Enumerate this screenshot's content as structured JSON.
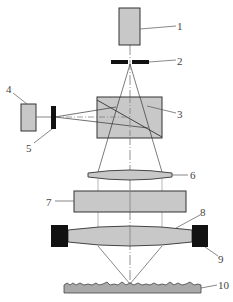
{
  "diagram": {
    "type": "optical-schematic",
    "colors": {
      "component_fill": "#c8c8c8",
      "stroke": "#333333",
      "block_fill": "#111111",
      "sample_fill": "#a9a9a9"
    },
    "labels": {
      "l1": "1",
      "l2": "2",
      "l3": "3",
      "l4": "4",
      "l5": "5",
      "l6": "6",
      "l7": "7",
      "l8": "8",
      "l9": "9",
      "l10": "10"
    },
    "components": [
      {
        "id": 1,
        "shape": "rectangle",
        "position": "top"
      },
      {
        "id": 2,
        "shape": "slit-aperture"
      },
      {
        "id": 3,
        "shape": "beam-splitter-box"
      },
      {
        "id": 4,
        "shape": "rectangle",
        "position": "left"
      },
      {
        "id": 5,
        "shape": "pinhole"
      },
      {
        "id": 6,
        "shape": "thin-lens"
      },
      {
        "id": 7,
        "shape": "rectangle"
      },
      {
        "id": 8,
        "shape": "biconvex-lens"
      },
      {
        "id": 9,
        "shape": "black-mounts"
      },
      {
        "id": 10,
        "shape": "rough-sample-surface"
      }
    ]
  }
}
